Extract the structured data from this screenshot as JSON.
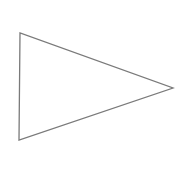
{
  "diagram": {
    "background": "#ffffff",
    "shapes": [
      {
        "type": "triangle",
        "points": "20,33 19,140 173,88",
        "stroke": "#7a7a7a",
        "stroke_width": "1.3",
        "fill": "none"
      }
    ]
  }
}
